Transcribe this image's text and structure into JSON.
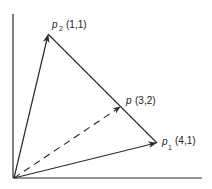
{
  "diagram": {
    "type": "vector-diagram",
    "colors": {
      "line": "#2a2a2a",
      "background": "#ffffff"
    },
    "axes": {
      "origin": [
        14,
        178
      ],
      "y_axis_top": [
        13,
        14
      ],
      "x_axis_end": [
        202,
        178
      ]
    },
    "points": [
      {
        "id": "p2",
        "name": "p",
        "subscript": "2",
        "coords": "(1,1)",
        "pos": [
          48,
          34
        ],
        "label_pos": [
          52,
          27
        ]
      },
      {
        "id": "p1",
        "name": "p",
        "subscript": "1",
        "coords": "(4,1)",
        "pos": [
          157,
          143
        ],
        "label_pos": [
          161,
          142
        ]
      },
      {
        "id": "p",
        "name": "p",
        "subscript": "",
        "coords": "(3,2)",
        "pos": [
          121,
          106
        ],
        "label_pos": [
          126,
          103
        ]
      }
    ],
    "edges": [
      {
        "from": "origin",
        "to": "p2",
        "style": "solid",
        "arrow": true
      },
      {
        "from": "origin",
        "to": "p1",
        "style": "solid",
        "arrow": true
      },
      {
        "from": "origin",
        "to": "p",
        "style": "dashed",
        "arrow": true
      },
      {
        "from": "p2",
        "to": "p1",
        "style": "solid",
        "arrow": false
      }
    ],
    "labels": {
      "p2_name": "p",
      "p2_sub": "2",
      "p2_coords": "(1,1)",
      "p1_name": "p",
      "p1_sub": "1",
      "p1_coords": "(4,1)",
      "p_name": "p",
      "p_coords": "(3,2)"
    }
  }
}
